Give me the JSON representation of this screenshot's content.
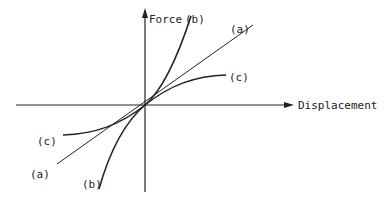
{
  "diagram": {
    "title": "",
    "axes": {
      "y_label": "Force",
      "x_label": "Displacement"
    },
    "curves": [
      {
        "id": "a",
        "label": "(a)",
        "shape": "linear"
      },
      {
        "id": "b",
        "label": "(b)",
        "shape": "stiffening"
      },
      {
        "id": "c",
        "label": "(c)",
        "shape": "softening"
      }
    ],
    "labels": {
      "b_top": "(b)",
      "a_top": "(a)",
      "c_right": "(c)",
      "c_left": "(c)",
      "a_bottom": "(a)",
      "b_bottom": "(b)"
    },
    "colors": {
      "ink": "#222222",
      "background": "#ffffff"
    }
  }
}
